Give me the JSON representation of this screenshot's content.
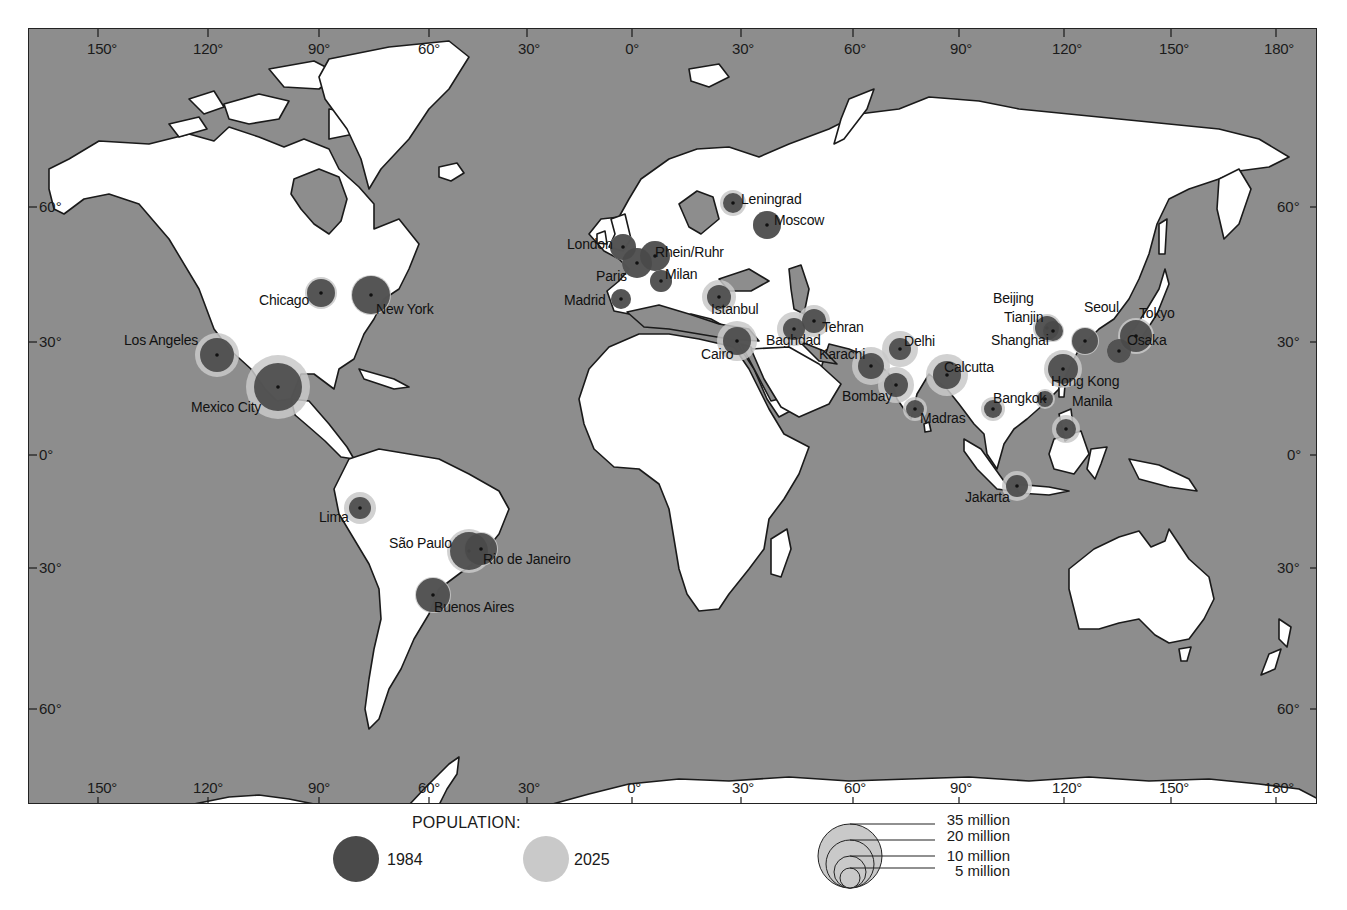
{
  "map": {
    "title": "World urban agglomerations: population 1984 vs 2025",
    "colors": {
      "ocean": "#8d8d8d",
      "land": "#ffffff",
      "coast": "#1a1a1a",
      "pop_1984": "#4a4a4a",
      "pop_2025": "#c9c9c9"
    },
    "longitude_ticks_top": [
      "150°",
      "120°",
      "90°",
      "60°",
      "30°",
      "0°",
      "30°",
      "60°",
      "90°",
      "120°",
      "150°",
      "180°"
    ],
    "longitude_ticks_bottom": [
      "150°",
      "120°",
      "90°",
      "60°",
      "30°",
      "0°",
      "30°",
      "60°",
      "90°",
      "120°",
      "150°",
      "180°"
    ],
    "latitude_ticks_left": [
      "60°",
      "30°",
      "0°",
      "30°",
      "60°"
    ],
    "latitude_ticks_right": [
      "60°",
      "30°",
      "0°",
      "30°",
      "60°"
    ],
    "cities": [
      {
        "name": "Los Angeles",
        "x": 188,
        "y": 326,
        "r84": 17,
        "r25": 22,
        "lx": 95,
        "ly": 303
      },
      {
        "name": "Chicago",
        "x": 292,
        "y": 264,
        "r84": 14,
        "r25": 16,
        "lx": 230,
        "ly": 263
      },
      {
        "name": "New York",
        "x": 342,
        "y": 266,
        "r84": 19,
        "r25": 20,
        "lx": 347,
        "ly": 272
      },
      {
        "name": "Mexico City",
        "x": 249,
        "y": 358,
        "r84": 24,
        "r25": 32,
        "lx": 162,
        "ly": 370
      },
      {
        "name": "Lima",
        "x": 331,
        "y": 479,
        "r84": 11,
        "r25": 16,
        "lx": 290,
        "ly": 480
      },
      {
        "name": "São Paulo",
        "x": 440,
        "y": 522,
        "r84": 19,
        "r25": 22,
        "lx": 360,
        "ly": 506
      },
      {
        "name": "Rio de Janeiro",
        "x": 452,
        "y": 520,
        "r84": 16,
        "r25": 17,
        "lx": 454,
        "ly": 522
      },
      {
        "name": "Buenos Aires",
        "x": 404,
        "y": 566,
        "r84": 17,
        "r25": 18,
        "lx": 405,
        "ly": 570
      },
      {
        "name": "London",
        "x": 594,
        "y": 218,
        "r84": 13,
        "r25": 13,
        "lx": 538,
        "ly": 207
      },
      {
        "name": "Rhein/Ruhr",
        "x": 626,
        "y": 227,
        "r84": 15,
        "r25": 15,
        "lx": 626,
        "ly": 215
      },
      {
        "name": "Paris",
        "x": 608,
        "y": 234,
        "r84": 15,
        "r25": 15,
        "lx": 567,
        "ly": 239
      },
      {
        "name": "Milan",
        "x": 632,
        "y": 252,
        "r84": 11,
        "r25": 11,
        "lx": 636,
        "ly": 237
      },
      {
        "name": "Madrid",
        "x": 592,
        "y": 270,
        "r84": 10,
        "r25": 10,
        "lx": 535,
        "ly": 263
      },
      {
        "name": "Leningrad",
        "x": 704,
        "y": 174,
        "r84": 10,
        "r25": 13,
        "lx": 712,
        "ly": 162
      },
      {
        "name": "Moscow",
        "x": 738,
        "y": 196,
        "r84": 14,
        "r25": 14,
        "lx": 745,
        "ly": 183
      },
      {
        "name": "Istanbul",
        "x": 690,
        "y": 268,
        "r84": 12,
        "r25": 17,
        "lx": 682,
        "ly": 272
      },
      {
        "name": "Cairo",
        "x": 708,
        "y": 312,
        "r84": 14,
        "r25": 20,
        "lx": 672,
        "ly": 317
      },
      {
        "name": "Baghdad",
        "x": 765,
        "y": 300,
        "r84": 11,
        "r25": 17,
        "lx": 737,
        "ly": 303
      },
      {
        "name": "Tehran",
        "x": 785,
        "y": 292,
        "r84": 12,
        "r25": 16,
        "lx": 793,
        "ly": 290
      },
      {
        "name": "Karachi",
        "x": 842,
        "y": 337,
        "r84": 13,
        "r25": 19,
        "lx": 790,
        "ly": 317
      },
      {
        "name": "Delhi",
        "x": 871,
        "y": 320,
        "r84": 11,
        "r25": 18,
        "lx": 875,
        "ly": 304
      },
      {
        "name": "Bombay",
        "x": 867,
        "y": 356,
        "r84": 12,
        "r25": 18,
        "lx": 813,
        "ly": 359
      },
      {
        "name": "Calcutta",
        "x": 918,
        "y": 346,
        "r84": 14,
        "r25": 21,
        "lx": 915,
        "ly": 330
      },
      {
        "name": "Madras",
        "x": 886,
        "y": 380,
        "r84": 9,
        "r25": 12,
        "lx": 891,
        "ly": 381
      },
      {
        "name": "Bangkok",
        "x": 964,
        "y": 380,
        "r84": 9,
        "r25": 12,
        "lx": 964,
        "ly": 361
      },
      {
        "name": "Jakarta",
        "x": 988,
        "y": 457,
        "r84": 11,
        "r25": 15,
        "lx": 936,
        "ly": 460
      },
      {
        "name": "Beijing",
        "x": 1018,
        "y": 299,
        "r84": 12,
        "r25": 14,
        "lx": 964,
        "ly": 261
      },
      {
        "name": "Tianjin",
        "x": 1024,
        "y": 302,
        "r84": 10,
        "r25": 11,
        "lx": 975,
        "ly": 280
      },
      {
        "name": "Seoul",
        "x": 1056,
        "y": 312,
        "r84": 13,
        "r25": 14,
        "lx": 1055,
        "ly": 270
      },
      {
        "name": "Shanghai",
        "x": 1034,
        "y": 340,
        "r84": 15,
        "r25": 19,
        "lx": 962,
        "ly": 303
      },
      {
        "name": "Tokyo",
        "x": 1107,
        "y": 307,
        "r84": 16,
        "r25": 18,
        "lx": 1110,
        "ly": 276
      },
      {
        "name": "Osaka",
        "x": 1090,
        "y": 322,
        "r84": 12,
        "r25": 12,
        "lx": 1098,
        "ly": 303
      },
      {
        "name": "Hong Kong",
        "x": 1016,
        "y": 370,
        "r84": 8,
        "r25": 10,
        "lx": 1022,
        "ly": 344
      },
      {
        "name": "Manila",
        "x": 1037,
        "y": 400,
        "r84": 10,
        "r25": 14,
        "lx": 1043,
        "ly": 364
      }
    ]
  },
  "legend": {
    "title": "POPULATION:",
    "series": [
      {
        "label": "1984",
        "color": "#4a4a4a"
      },
      {
        "label": "2025",
        "color": "#c9c9c9"
      }
    ],
    "scale": [
      "35 million",
      "20 million",
      "10 million",
      "5 million"
    ]
  }
}
